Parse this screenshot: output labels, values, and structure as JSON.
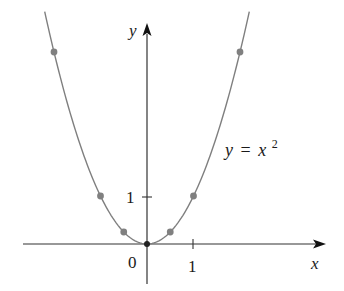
{
  "chart_data": {
    "type": "line",
    "title": "",
    "equation_label": "y = x²",
    "equation_parts": {
      "lhs": "y",
      "eq": "=",
      "base": "x",
      "exp": "2"
    },
    "xlabel": "x",
    "ylabel": "y",
    "x_ticks": [
      {
        "value": 1,
        "label": "1"
      }
    ],
    "y_ticks": [
      {
        "value": 1,
        "label": "1"
      }
    ],
    "origin_label": "0",
    "xlim": [
      -3.1,
      3.8
    ],
    "ylim": [
      -0.9,
      4.9
    ],
    "grid": false,
    "legend": "none",
    "series": [
      {
        "name": "y = x^2",
        "function": "x^2",
        "domain": [
          -2.2,
          2.2
        ],
        "color": "#7f7f7f"
      }
    ],
    "points": [
      {
        "x": -2,
        "y": 4
      },
      {
        "x": -1,
        "y": 1
      },
      {
        "x": -0.5,
        "y": 0.25
      },
      {
        "x": 0,
        "y": 0
      },
      {
        "x": 0.5,
        "y": 0.25
      },
      {
        "x": 1,
        "y": 1
      },
      {
        "x": 2,
        "y": 4
      }
    ],
    "point_color": "#808080",
    "axis_color": "#333333"
  },
  "labels": {
    "x_axis": "x",
    "y_axis": "y",
    "origin": "0",
    "x_tick_1": "1",
    "y_tick_1": "1",
    "eq_lhs": "y",
    "eq_sign": "=",
    "eq_base": "x",
    "eq_exp": "2"
  }
}
